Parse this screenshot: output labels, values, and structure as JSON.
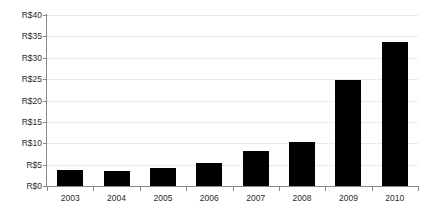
{
  "chart_data": {
    "type": "bar",
    "title": "",
    "subtitle": "",
    "xlabel": "",
    "ylabel": "",
    "categories": [
      "2003",
      "2004",
      "2005",
      "2006",
      "2007",
      "2008",
      "2009",
      "2010"
    ],
    "values": [
      3.8,
      3.5,
      4.3,
      5.4,
      8.2,
      10.3,
      24.7,
      33.6
    ],
    "series": [
      {
        "name": "",
        "values": [
          3.8,
          3.5,
          4.3,
          5.4,
          8.2,
          10.3,
          24.7,
          33.6
        ]
      }
    ],
    "ylim": [
      0,
      40
    ],
    "yticks": [
      0,
      5,
      10,
      15,
      20,
      25,
      30,
      35,
      40
    ],
    "ytick_labels": [
      "R$0",
      "R$5",
      "R$10",
      "R$15",
      "R$20",
      "R$25",
      "R$30",
      "R$35",
      "R$40"
    ],
    "currency_prefix": "R$",
    "grid": true,
    "grid_axis": "y",
    "grid_style": "dotted",
    "legend": false,
    "legend_position": "none",
    "bar_color": "#000000",
    "grid_color": "#d6d6d6",
    "axis_color": "#8a8a8a",
    "background_color": "#ffffff",
    "text_color": "#2b2b2b"
  }
}
